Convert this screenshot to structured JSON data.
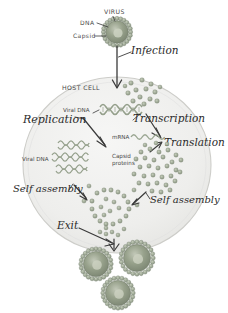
{
  "diagram": {
    "background_color": "#ffffff",
    "ink_color": "#2a2a2a",
    "host_cell_fill": "#f0f0ef",
    "host_cell_stroke": "#cfcfcf",
    "virus_color": "#8f9a86",
    "virus_core_color": "#b9c0ae",
    "protein_dot_color": "#9aa692",
    "dna_color": "#9aa692",
    "mrna_color": "#9aa692"
  },
  "labels": {
    "virus": "VIRUS",
    "dna": "DNA",
    "capsid": "Capsid",
    "infection": "Infection",
    "host_cell": "HOST CELL",
    "replication": "Replication",
    "viral_dna_top": "Viral DNA",
    "transcription": "Transcription",
    "mrna": "mRNA",
    "translation": "Translation",
    "capsid_proteins_line1": "Capsid",
    "capsid_proteins_line2": "proteins",
    "viral_dna_left": "Viral DNA",
    "self_assembly_left": "Self assembly",
    "self_assembly_right": "Self assembly",
    "exit": "Exit"
  },
  "structures": {
    "free_virus_top": {
      "cx": 117,
      "cy": 32,
      "r": 13,
      "spikes": 22
    },
    "released_viruses": [
      {
        "cx": 96,
        "cy": 264,
        "r": 15,
        "spikes": 24
      },
      {
        "cx": 137,
        "cy": 258,
        "r": 16,
        "spikes": 24
      },
      {
        "cx": 118,
        "cy": 293,
        "r": 15,
        "spikes": 24
      }
    ],
    "host_cell": {
      "cx": 117,
      "cy": 165,
      "rx": 94,
      "ry": 88
    },
    "dna_helices": [
      {
        "x": 100,
        "y": 107,
        "w": 44,
        "label": "replicating-dna-top"
      },
      {
        "x": 52,
        "y": 146,
        "w": 36,
        "label": "viral-dna-1"
      },
      {
        "x": 48,
        "y": 157,
        "w": 44,
        "label": "viral-dna-2"
      },
      {
        "x": 52,
        "y": 168,
        "w": 38,
        "label": "viral-dna-3"
      }
    ],
    "mrna_strand": {
      "x": 133,
      "y": 137,
      "w": 34
    }
  },
  "arrows": [
    {
      "name": "infection-arrow",
      "label": "Infection"
    },
    {
      "name": "replication-arrow",
      "label": "Replication"
    },
    {
      "name": "transcription-arrow",
      "label": "Transcription"
    },
    {
      "name": "translation-arrow",
      "label": "Translation"
    },
    {
      "name": "self-assembly-left-arrow",
      "label": "Self assembly"
    },
    {
      "name": "self-assembly-right-arrow",
      "label": "Self assembly"
    },
    {
      "name": "exit-arrow",
      "label": "Exit"
    }
  ]
}
